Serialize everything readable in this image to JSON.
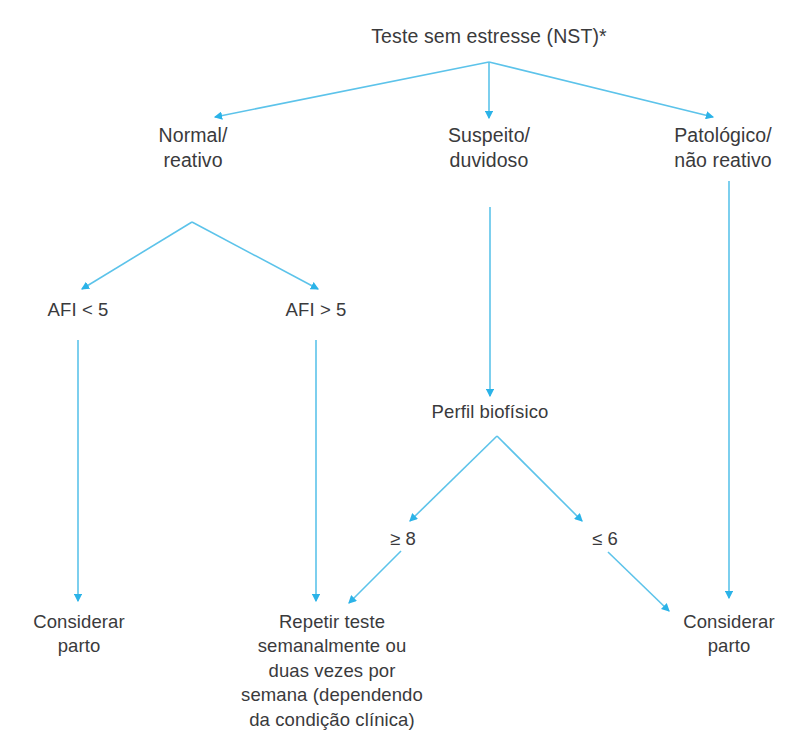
{
  "diagram": {
    "title": "Teste sem estresse (NST)*",
    "accent_color": "#3fb8e8",
    "text_color": "#3a3a3c",
    "background_color": "#ffffff",
    "nodes": [
      {
        "id": "nst",
        "label": "Teste sem estresse (NST)*"
      },
      {
        "id": "normal",
        "label": "Normal/\nreativo"
      },
      {
        "id": "suspeito",
        "label": "Suspeito/\nduvidoso"
      },
      {
        "id": "patologico",
        "label": "Patológico/\nnão reativo"
      },
      {
        "id": "afi_lt5",
        "label": "AFI < 5"
      },
      {
        "id": "afi_gt5",
        "label": "AFI > 5"
      },
      {
        "id": "perfil",
        "label": "Perfil biofísico"
      },
      {
        "id": "score_ge8",
        "label": "≥ 8"
      },
      {
        "id": "score_le6",
        "label": "≤ 6"
      },
      {
        "id": "considerar_parto_left",
        "label": "Considerar\nparto"
      },
      {
        "id": "repetir_teste",
        "label": "Repetir teste\nsemanalmente ou\nduas vezes por\nsemana (dependendo\nda condição clínica)"
      },
      {
        "id": "considerar_parto_right",
        "label": "Considerar\nparto"
      }
    ],
    "edges": [
      {
        "from": "nst",
        "to": "normal"
      },
      {
        "from": "nst",
        "to": "suspeito"
      },
      {
        "from": "nst",
        "to": "patologico"
      },
      {
        "from": "normal",
        "to": "afi_lt5"
      },
      {
        "from": "normal",
        "to": "afi_gt5"
      },
      {
        "from": "suspeito",
        "to": "perfil"
      },
      {
        "from": "perfil",
        "to": "score_ge8"
      },
      {
        "from": "perfil",
        "to": "score_le6"
      },
      {
        "from": "afi_lt5",
        "to": "considerar_parto_left"
      },
      {
        "from": "afi_gt5",
        "to": "repetir_teste"
      },
      {
        "from": "score_ge8",
        "to": "repetir_teste"
      },
      {
        "from": "score_le6",
        "to": "considerar_parto_right"
      },
      {
        "from": "patologico",
        "to": "considerar_parto_right"
      }
    ]
  }
}
